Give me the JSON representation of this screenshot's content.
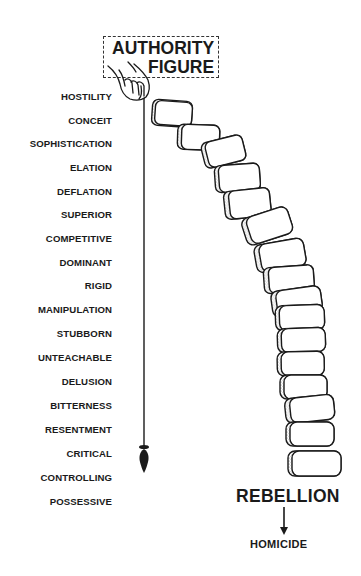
{
  "title": {
    "line1": "AUTHORITY",
    "line2": "FIGURE"
  },
  "traits": [
    {
      "label": "HOSTILITY",
      "y": 91
    },
    {
      "label": "CONCEIT",
      "y": 115
    },
    {
      "label": "SOPHISTICATION",
      "y": 138
    },
    {
      "label": "ELATION",
      "y": 162
    },
    {
      "label": "DEFLATION",
      "y": 186
    },
    {
      "label": "SUPERIOR",
      "y": 209
    },
    {
      "label": "COMPETITIVE",
      "y": 233
    },
    {
      "label": "DOMINANT",
      "y": 257
    },
    {
      "label": "RIGID",
      "y": 280
    },
    {
      "label": "MANIPULATION",
      "y": 304
    },
    {
      "label": "STUBBORN",
      "y": 328
    },
    {
      "label": "UNTEACHABLE",
      "y": 352
    },
    {
      "label": "DELUSION",
      "y": 376
    },
    {
      "label": "BITTERNESS",
      "y": 400
    },
    {
      "label": "RESENTMENT",
      "y": 424
    },
    {
      "label": "CRITICAL",
      "y": 448
    },
    {
      "label": "CONTROLLING",
      "y": 472
    },
    {
      "label": "POSSESSIVE",
      "y": 496
    }
  ],
  "outcome": {
    "primary": "REBELLION",
    "secondary": "HOMICIDE"
  },
  "icons": {
    "hand": "hand-holding-plumb-line-icon",
    "plumb_bob": "plumb-bob-icon",
    "blocks": "stacked-stone-blocks-icon",
    "arrow": "arrow-down-icon"
  },
  "colors": {
    "ink": "#1a1a1a",
    "background": "#ffffff",
    "stipple": "#777777"
  }
}
